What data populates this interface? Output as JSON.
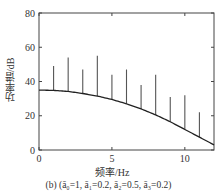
{
  "chart_data": {
    "type": "stem+line",
    "title": "",
    "caption": "(b) (ā₀=1, ā₁=0.2, ā₂=0.5, ā₃=0.2)",
    "xlabel": "频率/Hz",
    "ylabel": "功率谱/dB",
    "xlim": [
      0,
      12
    ],
    "ylim": [
      0,
      80
    ],
    "xticks": [
      0,
      5,
      10
    ],
    "yticks": [
      0,
      20,
      40,
      60,
      80
    ],
    "grid": false,
    "legend": null,
    "series": [
      {
        "name": "line spectrum (stems)",
        "type": "stem",
        "x": [
          1,
          2,
          3,
          4,
          5,
          6,
          7,
          8,
          9,
          10,
          11
        ],
        "values": [
          49,
          54,
          47,
          55,
          44,
          47,
          38,
          44,
          31,
          32,
          22
        ]
      },
      {
        "name": "spectral envelope",
        "type": "line",
        "x": [
          0,
          1,
          2,
          3,
          4,
          5,
          6,
          7,
          8,
          9,
          10,
          11,
          12
        ],
        "values": [
          35,
          34.8,
          34.2,
          33,
          31.5,
          29.5,
          27,
          24,
          20.5,
          16.5,
          12,
          7.5,
          3
        ]
      }
    ]
  },
  "labels": {
    "xlabel": "频率/Hz",
    "ylabel": "功率谱/dB",
    "caption": "(b) (ā₀=1, ā₁=0.2, ā₂=0.5, ā₃=0.2)",
    "xticks": [
      "0",
      "5",
      "10"
    ],
    "yticks": [
      "0",
      "20",
      "40",
      "60",
      "80"
    ]
  },
  "colors": {
    "axis": "#444444",
    "stem": "#555555",
    "curve": "#222222"
  }
}
